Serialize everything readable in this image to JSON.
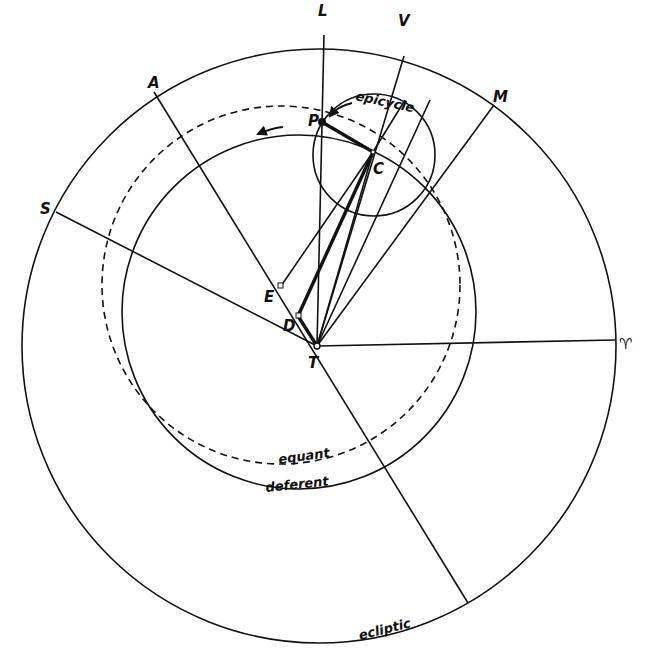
{
  "diagram": {
    "ink_color": "#111111",
    "background": "#ffffff",
    "circles": [
      {
        "id": "ecliptic",
        "label": "ecliptic",
        "style": "solid"
      },
      {
        "id": "deferent",
        "label": "deferent",
        "style": "solid"
      },
      {
        "id": "equant",
        "label": "equant",
        "style": "dashed"
      },
      {
        "id": "epicycle",
        "label": "epicycle",
        "style": "solid"
      }
    ],
    "points": {
      "T": "T",
      "D": "D",
      "E": "E",
      "C": "C",
      "P": "P"
    },
    "directions": {
      "L": "L",
      "V": "V",
      "M": "M",
      "A": "A",
      "S": "S",
      "aries": "♈"
    },
    "labels": {
      "ecliptic": "ecliptic",
      "deferent": "deferent",
      "equant": "equant",
      "epicycle": "epicycle"
    },
    "arrows": [
      {
        "id": "epicycle-motion",
        "direction": "counterclockwise"
      },
      {
        "id": "deferent-motion",
        "direction": "counterclockwise"
      }
    ]
  }
}
